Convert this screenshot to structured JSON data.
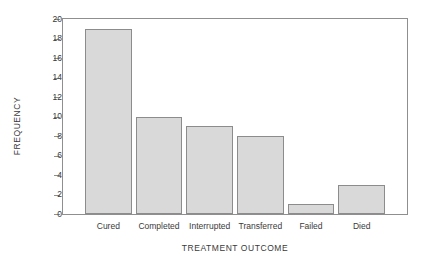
{
  "chart_data": {
    "type": "bar",
    "title": "",
    "subtitle": "",
    "xlabel": "TREATMENT OUTCOME",
    "ylabel": "FREQUENCY",
    "categories": [
      "Cured",
      "Completed",
      "Interrupted",
      "Transferred",
      "Failed",
      "Died"
    ],
    "values": [
      19,
      10,
      9,
      8,
      1,
      3
    ],
    "ylim": [
      0,
      20
    ],
    "ytick_step": 2,
    "yticks": [
      0,
      2,
      4,
      6,
      8,
      10,
      12,
      14,
      16,
      18,
      20
    ],
    "ytick_labels": [
      "0",
      "2",
      "4",
      "6",
      "8",
      "10",
      "12",
      "14",
      "16",
      "18",
      "20"
    ],
    "grid": false,
    "legend": false,
    "legend_position": "none",
    "bar_fill_color": "#d9d9d9",
    "bar_edge_color": "#8c8c8c",
    "axis_color": "#8f8f8f",
    "text_color": "#3a3a3a",
    "background_color": "#ffffff"
  }
}
